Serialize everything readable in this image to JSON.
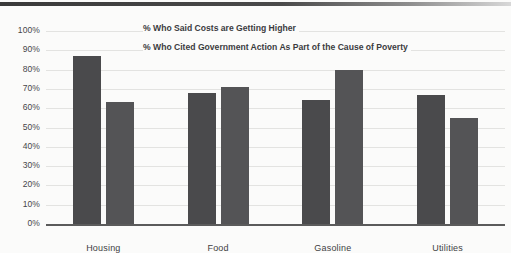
{
  "chart_data": {
    "type": "bar",
    "title": "",
    "subtitle": "",
    "xlabel": "",
    "ylabel": "",
    "ylim": [
      0,
      100
    ],
    "grid": true,
    "legend_position": "top-center",
    "categories": [
      "Housing",
      "Food",
      "Gasoline",
      "Utilities"
    ],
    "ytick_labels": [
      "100%",
      "90%",
      "80%",
      "70%",
      "60%",
      "50%",
      "40%",
      "30%",
      "20%",
      "10%",
      "0%"
    ],
    "ytick_values": [
      100,
      90,
      80,
      70,
      60,
      50,
      40,
      30,
      20,
      10,
      0
    ],
    "series": [
      {
        "name": "% Who Said Costs are Getting Higher",
        "color": "#4a4a4c",
        "values": [
          87,
          68,
          64,
          67
        ]
      },
      {
        "name": "% Who Cited Government Action As Part of the Cause of Poverty",
        "color": "#545456",
        "values": [
          63,
          71,
          80,
          55
        ]
      }
    ]
  },
  "legend": {
    "lines": [
      "% Who Said Costs are Getting Higher",
      "% Who Cited Government Action As Part of the Cause of Poverty"
    ]
  }
}
